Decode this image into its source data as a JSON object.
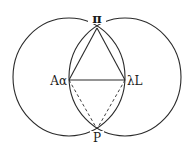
{
  "figure": {
    "type": "geometric-construction",
    "stroke_color": "#2a2a2a",
    "background": "#ffffff",
    "labels": {
      "top": "π",
      "left": "Aα",
      "right": "λL",
      "bottom": "P"
    },
    "points": {
      "top": [
        97,
        28
      ],
      "left": [
        69,
        80
      ],
      "right": [
        125,
        80
      ],
      "bottom": [
        97,
        129
      ]
    },
    "circles": [
      {
        "cx": 69,
        "cy": 77,
        "rx": 56,
        "ry": 59
      },
      {
        "cx": 125,
        "cy": 77,
        "rx": 56,
        "ry": 59
      }
    ],
    "solid_segments": [
      [
        "top",
        "left"
      ],
      [
        "top",
        "right"
      ],
      [
        "left",
        "right"
      ]
    ],
    "dashed_segments": [
      [
        "left",
        "bottom"
      ],
      [
        "right",
        "bottom"
      ]
    ]
  }
}
